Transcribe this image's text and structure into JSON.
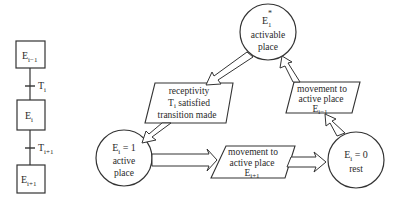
{
  "ladder": {
    "steps": [
      {
        "label": "E",
        "sub": "i−1"
      },
      {
        "label": "E",
        "sub": "i"
      },
      {
        "label": "E",
        "sub": "i+1"
      }
    ],
    "transitions": [
      {
        "label": "T",
        "sub": "i"
      },
      {
        "label": "T",
        "sub": "i+1"
      }
    ]
  },
  "cycle": {
    "activable": {
      "title": "E",
      "sub": "1",
      "sup": "*",
      "line1": "activable",
      "line2": "place"
    },
    "active": {
      "title": "E",
      "sub": "i",
      "eq": " = 1",
      "line1": "active",
      "line2": "place"
    },
    "rest": {
      "title": "E",
      "sub": "i",
      "eq": " = 0",
      "line1": "rest"
    },
    "box_receptivity": {
      "line1": "receptivity",
      "line2_pre": "T",
      "line2_sub": "i",
      "line2_post": " satisfied",
      "line3": "transition made"
    },
    "box_next": {
      "line1": "movement to",
      "line2": "active place",
      "line3": "E",
      "line3_sub": "i+1"
    },
    "box_prev": {
      "line1": "movement to",
      "line2": "active place",
      "line3": "E",
      "line3_sub": "i−1"
    }
  }
}
